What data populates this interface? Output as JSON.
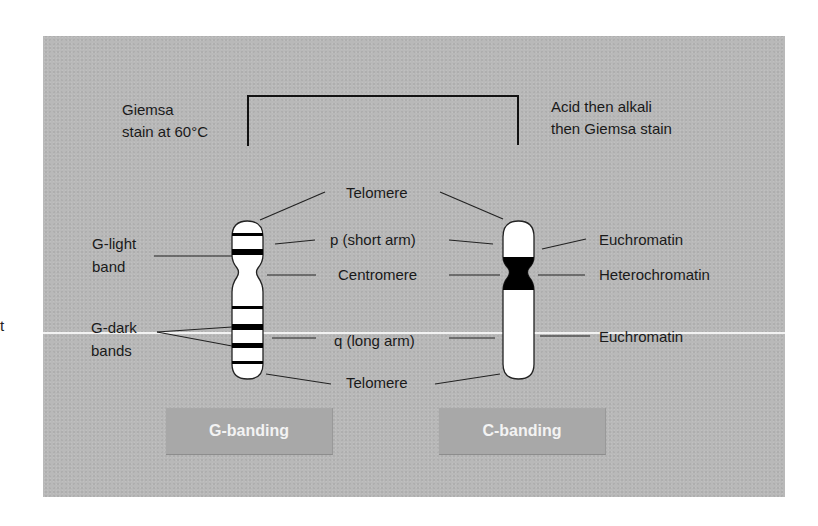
{
  "left_edge_fragment": "t",
  "bracket": {
    "left_caption": [
      "Giemsa",
      "stain at 60°C"
    ],
    "right_caption": [
      "Acid then alkali",
      "then Giemsa stain"
    ]
  },
  "center_labels": {
    "telomere_top": "Telomere",
    "p_arm": "p (short arm)",
    "centromere": "Centromere",
    "q_arm": "q (long arm)",
    "telomere_bottom": "Telomere"
  },
  "g_chromosome": {
    "labels": {
      "light_band": [
        "G-light",
        "band"
      ],
      "dark_bands": [
        "G-dark",
        "bands"
      ]
    },
    "band_color": "#000000",
    "body_color": "#ffffff"
  },
  "c_chromosome": {
    "labels": {
      "euchromatin_top": "Euchromatin",
      "heterochromatin": "Heterochromatin",
      "euchromatin_bottom": "Euchromatin"
    },
    "heterochromatin_color": "#000000"
  },
  "buttons": {
    "g_banding": "G-banding",
    "c_banding": "C-banding"
  },
  "colors": {
    "panel_bg": "#b9b9b9",
    "button_bg": "#a8a8a8",
    "button_text": "#f3f3f3",
    "text": "#1a1a1a"
  }
}
